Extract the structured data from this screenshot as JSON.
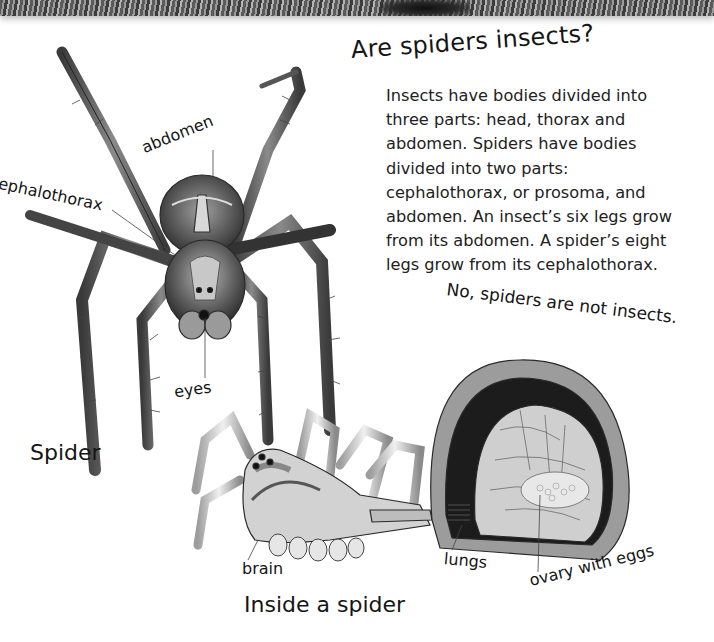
{
  "header_photo": {
    "description": "greyscale close-up photo strip (cropped)"
  },
  "heading": {
    "title": "Are spiders insects?"
  },
  "body": {
    "paragraph": "Insects have bodies divided into three parts: head, thorax and abdomen. Spiders have bodies divided into two parts: cephalothorax, or prosoma, and abdomen. An insect’s six legs grow from its abdomen. A spider’s eight legs grow from its cephalothorax."
  },
  "answer": {
    "text": "No, spiders are not insects."
  },
  "spider_illustration": {
    "caption": "Spider",
    "labels": {
      "abdomen": "abdomen",
      "cephalothorax": "cephalothorax",
      "eyes": "eyes"
    }
  },
  "cross_section": {
    "caption": "Inside a spider",
    "labels": {
      "brain": "brain",
      "lungs": "lungs",
      "ovary": "ovary with eggs"
    }
  },
  "colors": {
    "ink": "#151515",
    "paper": "#ffffff",
    "shading": "#6e6e6e"
  }
}
